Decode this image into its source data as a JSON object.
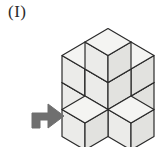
{
  "figure": {
    "label": "(I)",
    "kind": "isometric-cube-stack",
    "background_color": "#ffffff"
  },
  "colors": {
    "face_top": "#f4f4f2",
    "face_left": "#ebebe9",
    "face_right": "#e2e2df",
    "outline": "#2b2b2b",
    "arrow_fill": "#6f6f6f",
    "arrow_stroke": "#6f6f6f",
    "label_color": "#2b2b2b"
  },
  "geometry": {
    "origin_x": 108,
    "origin_y": 96,
    "half_width": 23,
    "half_height": 13.5,
    "cube_height": 27,
    "stroke_width": 1.2
  },
  "structure": {
    "description": "Stepped isometric pyramid of unit cubes",
    "layers": [
      {
        "level": 0,
        "name": "bottom-layer",
        "cells": [
          {
            "gx": 0,
            "gy": 0
          },
          {
            "gx": 1,
            "gy": 0
          },
          {
            "gx": 0,
            "gy": 1
          },
          {
            "gx": -1,
            "gy": 0
          },
          {
            "gx": 0,
            "gy": -1
          }
        ]
      },
      {
        "level": 1,
        "name": "middle-layer",
        "cells": [
          {
            "gx": 0,
            "gy": 0
          },
          {
            "gx": -1,
            "gy": 0
          },
          {
            "gx": 0,
            "gy": -1
          }
        ]
      },
      {
        "level": 2,
        "name": "top-layer",
        "cells": [
          {
            "gx": 0,
            "gy": 0
          }
        ]
      }
    ],
    "visible_cube_count": 9
  },
  "arrow": {
    "name": "direction-arrow",
    "direction": "up-right",
    "points": "32,128 32,113 48,113 48,104 64,116 48,128 48,120 40,120 40,128",
    "rotation_deg": 0
  }
}
